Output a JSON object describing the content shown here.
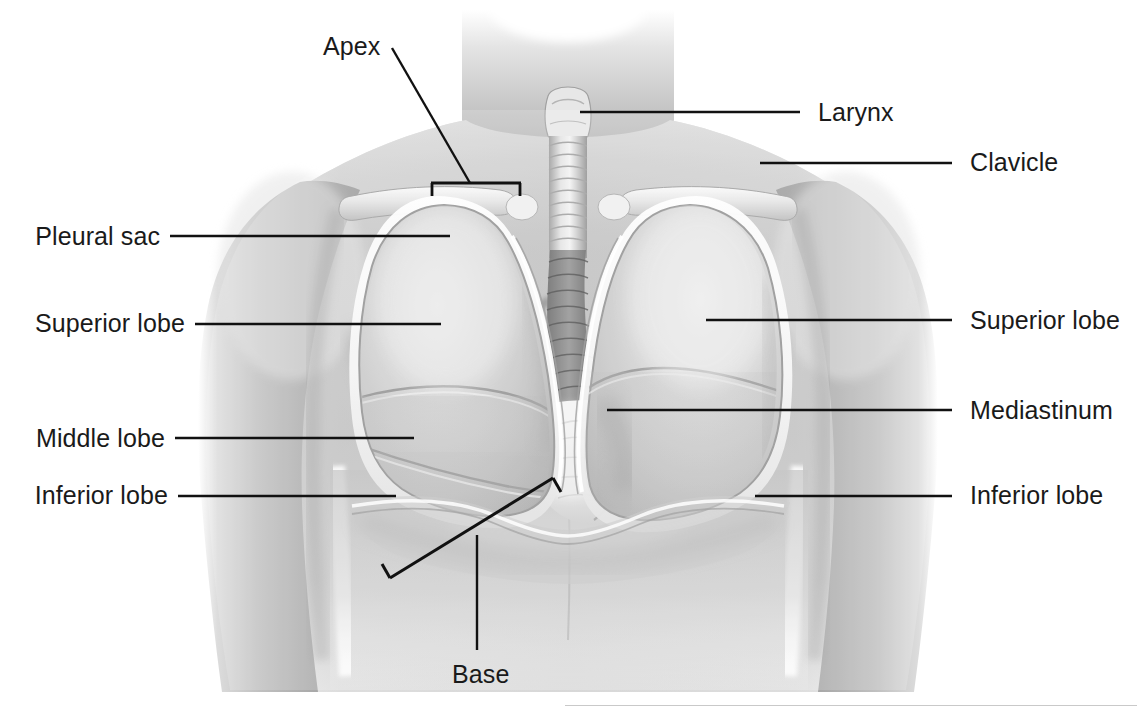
{
  "figure": {
    "background_color": "#ffffff",
    "leader_color": "#111111",
    "text_color": "#1a1a1a"
  },
  "labels": {
    "apex": "Apex",
    "larynx": "Larynx",
    "clavicle": "Clavicle",
    "pleural_sac": "Pleural sac",
    "superior_lobe_left": "Superior lobe",
    "superior_lobe_right": "Superior lobe",
    "middle_lobe": "Middle lobe",
    "mediastinum": "Mediastinum",
    "inferior_lobe_left": "Inferior lobe",
    "inferior_lobe_right": "Inferior lobe",
    "base": "Base"
  },
  "callouts": [
    {
      "id": "apex",
      "text": "Apex",
      "side": "top",
      "text_x": 323,
      "text_y": 34,
      "anchor_x": 431,
      "anchor_y": 183
    },
    {
      "id": "larynx",
      "text": "Larynx",
      "side": "right",
      "text_x": 818,
      "text_y": 100,
      "anchor_x": 580,
      "anchor_y": 112
    },
    {
      "id": "clavicle",
      "text": "Clavicle",
      "side": "right",
      "text_x": 970,
      "text_y": 150,
      "anchor_x": 760,
      "anchor_y": 163
    },
    {
      "id": "pleural-sac",
      "text": "Pleural sac",
      "side": "left",
      "text_x": 43,
      "text_y": 224,
      "anchor_x": 450,
      "anchor_y": 236
    },
    {
      "id": "superior-lobe-left",
      "text": "Superior lobe",
      "side": "left",
      "text_x": 30,
      "text_y": 310,
      "anchor_x": 441,
      "anchor_y": 324
    },
    {
      "id": "superior-lobe-right",
      "text": "Superior lobe",
      "side": "right",
      "text_x": 970,
      "text_y": 310,
      "anchor_x": 706,
      "anchor_y": 320
    },
    {
      "id": "middle-lobe",
      "text": "Middle lobe",
      "side": "left",
      "text_x": 36,
      "text_y": 426,
      "anchor_x": 414,
      "anchor_y": 438
    },
    {
      "id": "mediastinum",
      "text": "Mediastinum",
      "side": "right",
      "text_x": 970,
      "text_y": 397,
      "anchor_x": 607,
      "anchor_y": 410
    },
    {
      "id": "inferior-lobe-left",
      "text": "Inferior lobe",
      "side": "left",
      "text_x": 40,
      "text_y": 483,
      "anchor_x": 396,
      "anchor_y": 496
    },
    {
      "id": "inferior-lobe-right",
      "text": "Inferior lobe",
      "side": "right",
      "text_x": 970,
      "text_y": 483,
      "anchor_x": 755,
      "anchor_y": 496
    },
    {
      "id": "base",
      "text": "Base",
      "side": "bottom",
      "text_x": 452,
      "text_y": 668,
      "anchor_x": 477,
      "anchor_y": 535
    }
  ],
  "brackets": {
    "apex": {
      "x1": 431,
      "x2": 521,
      "y": 183,
      "tick": 12,
      "direction": "down"
    },
    "base": {
      "x1": 390,
      "y1": 578,
      "x2": 553,
      "y2": 478,
      "tick": 14
    }
  },
  "anatomy_regions": [
    "neck",
    "larynx",
    "trachea",
    "clavicle-left",
    "clavicle-right",
    "shoulder-left",
    "shoulder-right",
    "arm-left",
    "arm-right",
    "lung-left",
    "lung-right",
    "pleural-sac-outline",
    "superior-lobe-left",
    "middle-lobe-left",
    "inferior-lobe-left",
    "superior-lobe-right",
    "inferior-lobe-right",
    "mediastinum",
    "heart-region",
    "diaphragm-base",
    "abdomen"
  ]
}
